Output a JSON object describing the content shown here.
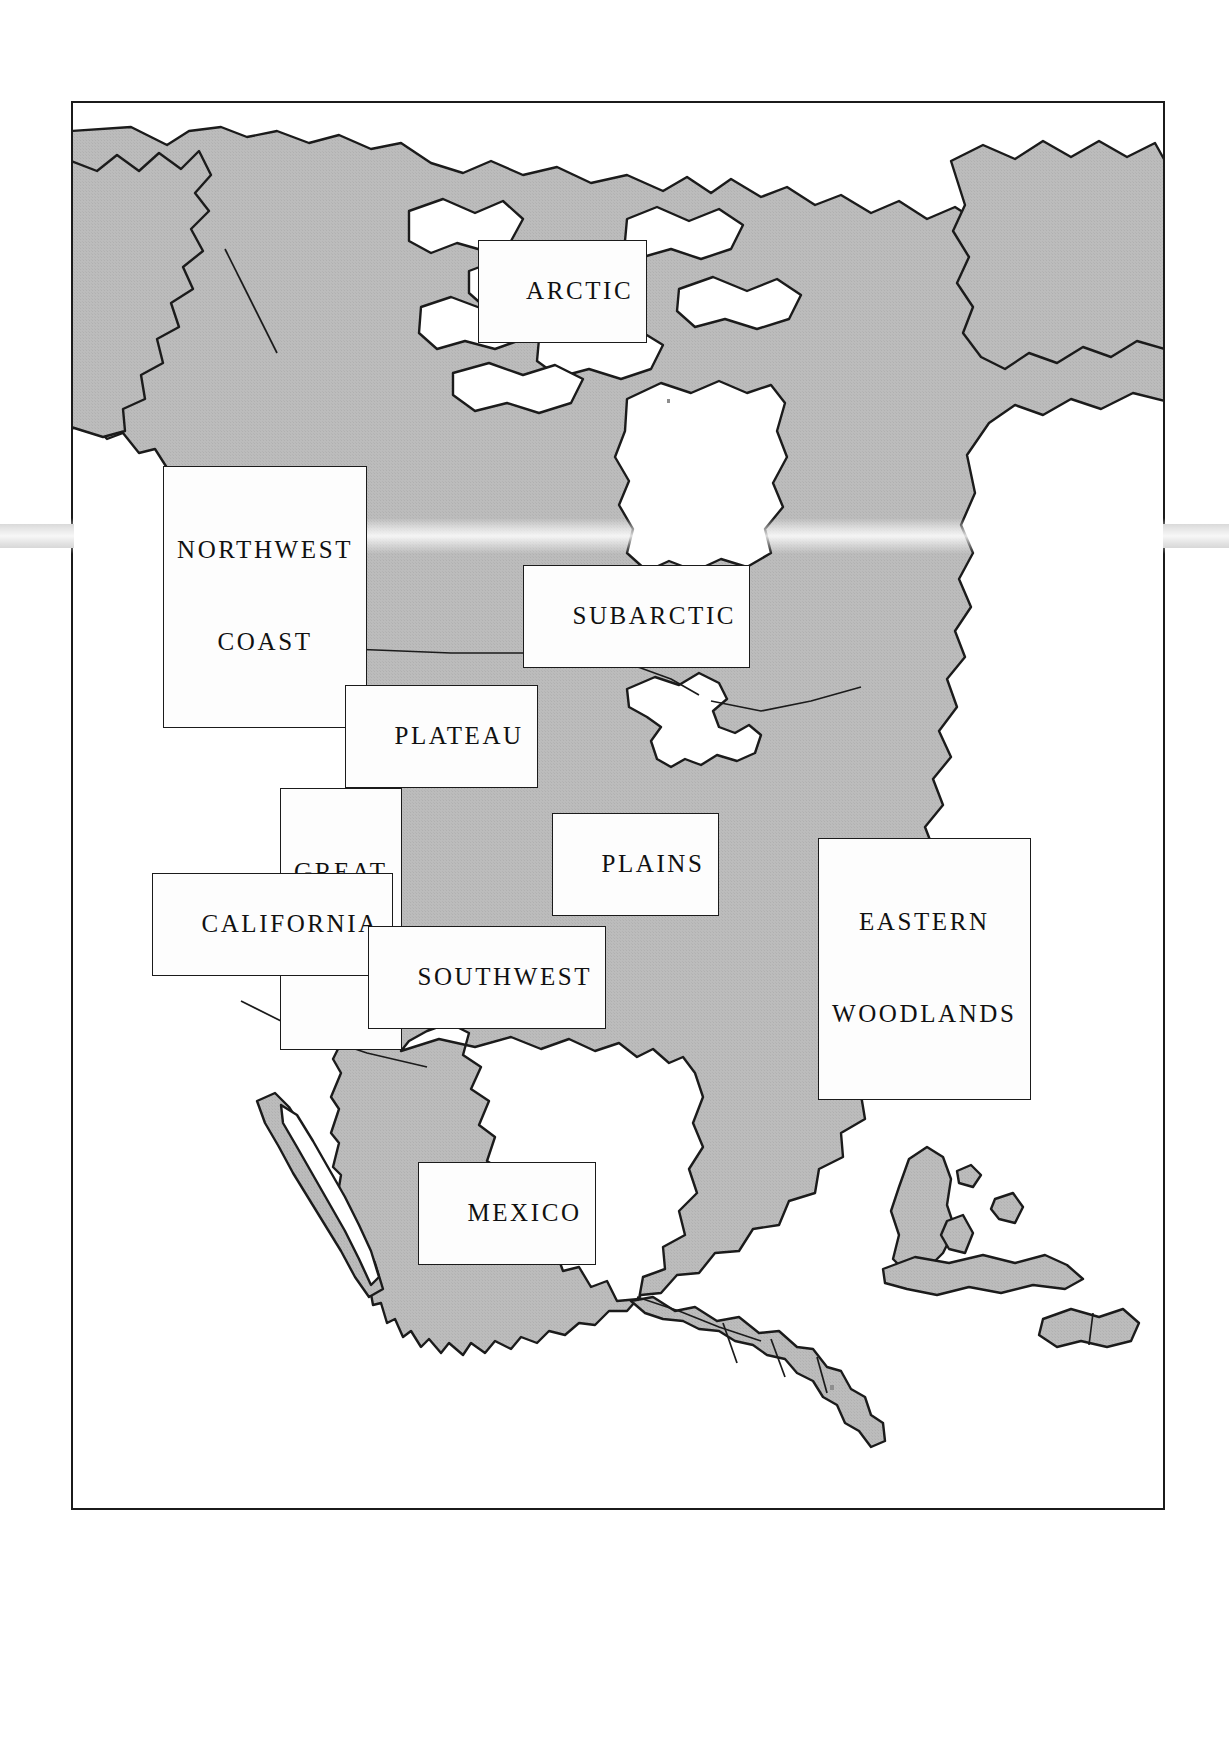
{
  "document": {
    "type": "map",
    "subject": "North America Native American culture areas",
    "orientation": "portrait"
  },
  "map": {
    "frame": {
      "border_color": "#1b1b1b",
      "background_color": "#ffffff"
    },
    "land_fill_color": "#b9b9b9",
    "water_fill_color": "#ffffff",
    "outline_color": "#1b1b1b",
    "page_background_color": "#ffffff"
  },
  "labels": [
    {
      "id": "arctic",
      "text": "ARCTIC",
      "lines": [
        "ARCTIC"
      ]
    },
    {
      "id": "northwest-coast",
      "text": "NORTHWEST COAST",
      "lines": [
        "NORTHWEST",
        "COAST"
      ]
    },
    {
      "id": "subarctic",
      "text": "SUBARCTIC",
      "lines": [
        "SUBARCTIC"
      ]
    },
    {
      "id": "plateau",
      "text": "PLATEAU",
      "lines": [
        "PLATEAU"
      ]
    },
    {
      "id": "great-basin",
      "text": "GREAT BASIN",
      "lines": [
        "GREAT",
        "BASIN"
      ]
    },
    {
      "id": "plains",
      "text": "PLAINS",
      "lines": [
        "PLAINS"
      ]
    },
    {
      "id": "eastern-woodlands",
      "text": "EASTERN WOODLANDS",
      "lines": [
        "EASTERN",
        "WOODLANDS"
      ]
    },
    {
      "id": "california",
      "text": "CALIFORNIA",
      "lines": [
        "CALIFORNIA"
      ]
    },
    {
      "id": "southwest",
      "text": "SOUTHWEST",
      "lines": [
        "SOUTHWEST"
      ]
    },
    {
      "id": "mexico",
      "text": "MEXICO",
      "lines": [
        "MEXICO"
      ]
    }
  ],
  "label_text": {
    "arctic": "ARCTIC",
    "northwest_coast_line1": "NORTHWEST",
    "northwest_coast_line2": "COAST",
    "subarctic": "SUBARCTIC",
    "plateau": "PLATEAU",
    "great_basin_line1": "GREAT",
    "great_basin_line2": "BASIN",
    "plains": "PLAINS",
    "eastern_woodlands_line1": "EASTERN",
    "eastern_woodlands_line2": "WOODLANDS",
    "california": "CALIFORNIA",
    "southwest": "SOUTHWEST",
    "mexico": "MEXICO"
  }
}
